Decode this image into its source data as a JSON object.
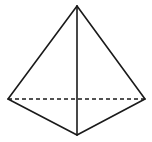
{
  "figure": {
    "type": "tetrahedron",
    "stroke_color": "#1a1a1a",
    "background": "#ffffff",
    "vertices": {
      "apex": [
        77,
        6
      ],
      "left": [
        8,
        99
      ],
      "right": [
        145,
        99
      ],
      "front": [
        77,
        135
      ]
    },
    "edges": [
      {
        "from": "apex",
        "to": "left",
        "style": "solid"
      },
      {
        "from": "apex",
        "to": "right",
        "style": "solid"
      },
      {
        "from": "apex",
        "to": "front",
        "style": "solid"
      },
      {
        "from": "left",
        "to": "front",
        "style": "solid"
      },
      {
        "from": "right",
        "to": "front",
        "style": "solid"
      },
      {
        "from": "left",
        "to": "right",
        "style": "dashed"
      }
    ]
  }
}
